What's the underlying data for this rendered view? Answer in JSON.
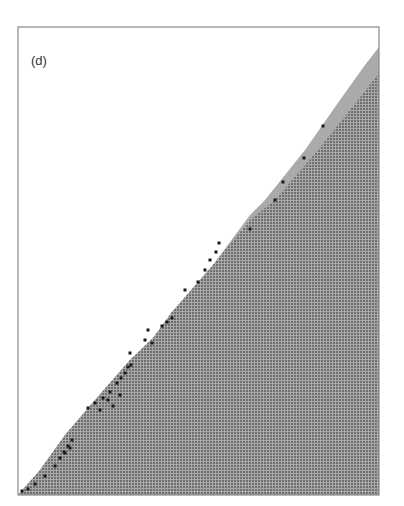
{
  "figure": {
    "panel_label": "(d)",
    "frame": {
      "left": 18,
      "top": 27,
      "right": 379,
      "bottom": 495,
      "stroke": "#888888"
    },
    "colors": {
      "background": "#ffffff",
      "fill_cell": "#6e6e6e",
      "fill_grid": "#a9a9a9",
      "band": "#aaaaaa",
      "markers": "#1a1a1a"
    },
    "grid_spacing": 3,
    "band_outer_edge": [
      [
        18,
        495
      ],
      [
        40,
        470
      ],
      [
        65,
        435
      ],
      [
        95,
        400
      ],
      [
        130,
        360
      ],
      [
        153,
        338
      ],
      [
        172,
        312
      ],
      [
        213,
        265
      ],
      [
        250,
        215
      ],
      [
        265,
        200
      ],
      [
        305,
        150
      ],
      [
        340,
        100
      ],
      [
        365,
        65
      ],
      [
        379,
        47
      ]
    ],
    "dark_edge": [
      [
        18,
        495
      ],
      [
        40,
        470
      ],
      [
        65,
        435
      ],
      [
        95,
        400
      ],
      [
        130,
        360
      ],
      [
        153,
        338
      ],
      [
        172,
        312
      ],
      [
        213,
        265
      ],
      [
        250,
        220
      ],
      [
        275,
        200
      ],
      [
        318,
        150
      ],
      [
        358,
        100
      ],
      [
        379,
        73
      ]
    ],
    "markers": [
      [
        22,
        491
      ],
      [
        28,
        489
      ],
      [
        35,
        484
      ],
      [
        45,
        476
      ],
      [
        55,
        466
      ],
      [
        60,
        458
      ],
      [
        64,
        452
      ],
      [
        68,
        446
      ],
      [
        72,
        440
      ],
      [
        65,
        453
      ],
      [
        70,
        448
      ],
      [
        88,
        408
      ],
      [
        95,
        403
      ],
      [
        100,
        410
      ],
      [
        103,
        398
      ],
      [
        110,
        392
      ],
      [
        117,
        383
      ],
      [
        121,
        378
      ],
      [
        125,
        373
      ],
      [
        128,
        367
      ],
      [
        131,
        365
      ],
      [
        108,
        400
      ],
      [
        113,
        406
      ],
      [
        120,
        395
      ],
      [
        130,
        353
      ],
      [
        145,
        340
      ],
      [
        148,
        330
      ],
      [
        152,
        343
      ],
      [
        162,
        326
      ],
      [
        167,
        322
      ],
      [
        172,
        318
      ],
      [
        185,
        290
      ],
      [
        198,
        282
      ],
      [
        205,
        270
      ],
      [
        210,
        260
      ],
      [
        216,
        252
      ],
      [
        219,
        243
      ],
      [
        250,
        229
      ],
      [
        275,
        200
      ],
      [
        283,
        182
      ],
      [
        304,
        158
      ],
      [
        323,
        126
      ]
    ]
  }
}
